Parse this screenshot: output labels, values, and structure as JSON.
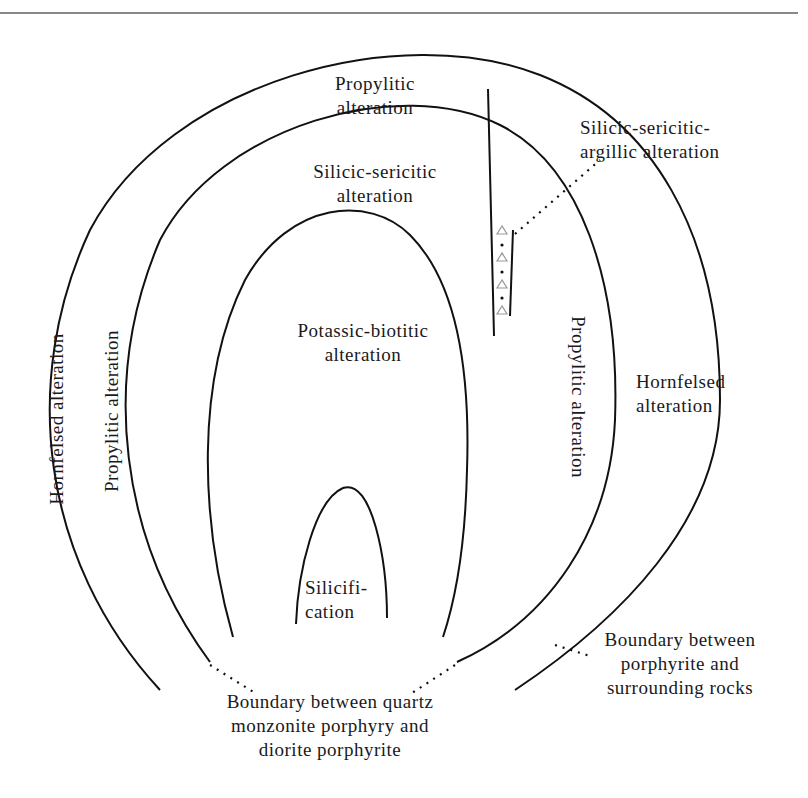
{
  "figure": {
    "type": "alteration-zoning-diagram",
    "zones": {
      "propylitic_top": [
        "Propylitic",
        "alteration"
      ],
      "silicic_sericitic": [
        "Silicic-sericitic",
        "alteration"
      ],
      "silicic_sericitic_argillic": [
        "Silicic-sericitic-",
        "argillic alteration"
      ],
      "potassic_biotitic": [
        "Potassic-biotitic",
        "alteration"
      ],
      "silicification": [
        "Silicifi-",
        "cation"
      ],
      "hornfelsed_left": "Hornfelsed alteration",
      "propylitic_left": "Propylitic alteration",
      "propylitic_right": "Propylitic alteration",
      "hornfelsed_right": [
        "Hornfelsed",
        "alteration"
      ]
    },
    "boundaries": {
      "inner": [
        "Boundary between quartz",
        "monzonite porphyry and",
        "diorite porphyrite"
      ],
      "outer": [
        "Boundary between",
        "porphyrite and",
        "surrounding rocks"
      ]
    },
    "colors": {
      "line": "#111111",
      "text": "#1a1a1a",
      "breccia_symbol": "#999999",
      "top_rule": "#888888"
    }
  }
}
